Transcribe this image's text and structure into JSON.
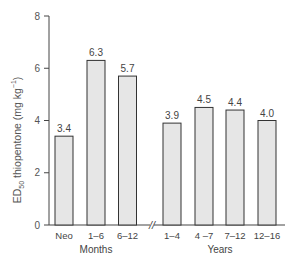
{
  "chart_data": {
    "type": "bar",
    "title": "",
    "ylabel": "ED50 thiopentone (mg kg-1)",
    "ylabel_parts": {
      "pre": "ED",
      "sub": "50",
      "mid": " thiopentone (mg kg",
      "sup": "−1",
      "post": ")"
    },
    "ylim": [
      0,
      8
    ],
    "yticks": [
      "0",
      "2",
      "4",
      "6",
      "8"
    ],
    "grid": false,
    "groups": [
      {
        "label": "Months",
        "categories": [
          "Neo",
          "1–6",
          "6–12"
        ],
        "values": [
          3.4,
          6.3,
          5.7
        ]
      },
      {
        "label": "Years",
        "categories": [
          "1–4",
          "4 –7",
          "7–12",
          "12–16"
        ],
        "values": [
          3.9,
          4.5,
          4.4,
          4.0
        ]
      }
    ],
    "categories": [
      "Neo",
      "1–6",
      "6–12",
      "1–4",
      "4 –7",
      "7–12",
      "12–16"
    ],
    "values": [
      3.4,
      6.3,
      5.7,
      3.9,
      4.5,
      4.4,
      4.0
    ],
    "value_labels": [
      "3.4",
      "6.3",
      "5.7",
      "3.9",
      "4.5",
      "4.4",
      "4.0"
    ],
    "axis_break": "//",
    "bar_fill": "#e6e6e6",
    "bar_stroke": "#333333"
  }
}
